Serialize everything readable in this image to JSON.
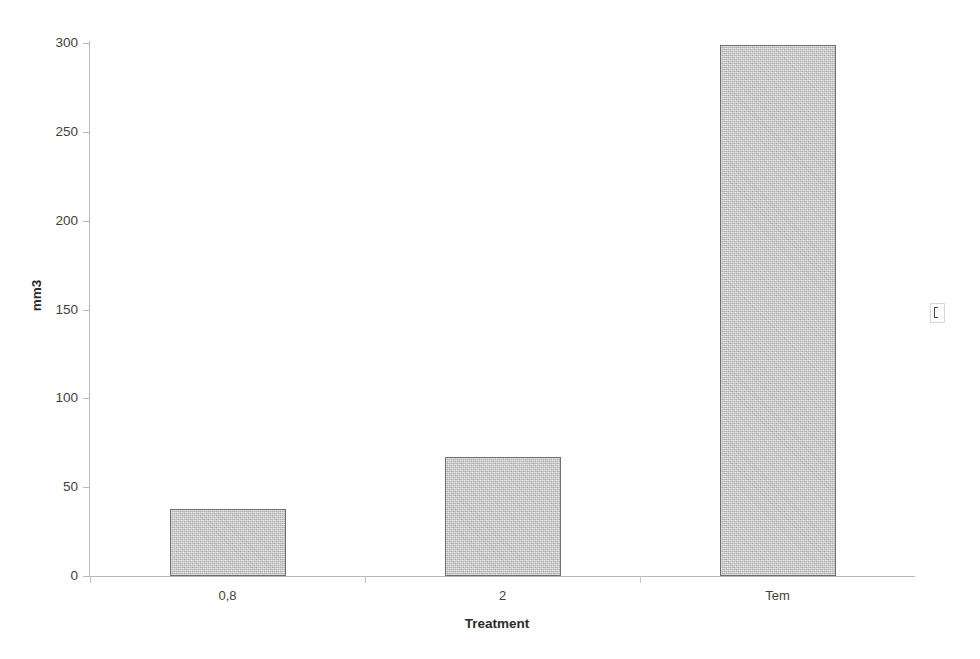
{
  "chart_data": {
    "type": "bar",
    "title": "",
    "subtitle": "",
    "xlabel": "Treatment",
    "ylabel": "mm3",
    "categories": [
      "0,8",
      "2",
      "Tem"
    ],
    "values": [
      38,
      67,
      299
    ],
    "series": [
      {
        "name": "mm3",
        "values": [
          38,
          67,
          299
        ]
      }
    ],
    "ylim": [
      0,
      300
    ],
    "yticks": [
      0,
      50,
      100,
      150,
      200,
      250,
      300
    ],
    "ytick_labels": [
      "0",
      "50",
      "100",
      "150",
      "200",
      "250",
      "300"
    ],
    "grid": false,
    "legend": "none",
    "bar_fill_color": "#c4c4c4",
    "bar_border_color": "#6f6f6f",
    "axis_color": "#b9b9b9",
    "text_color": "#3f3f3f"
  },
  "figure": {
    "y_axis_title": "mm3",
    "x_axis_title": "Treatment",
    "background_color": "#ffffff"
  },
  "artifact": {
    "label": ""
  }
}
